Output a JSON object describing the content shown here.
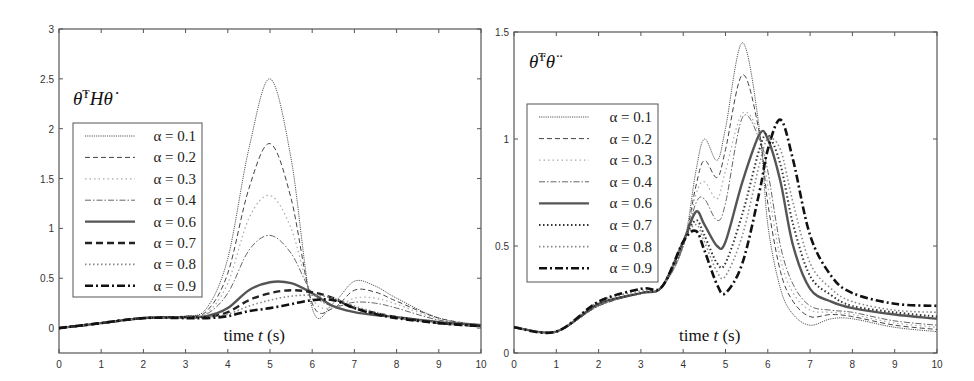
{
  "chart_data": [
    {
      "type": "line",
      "title": "θ̇ᵀHθ̇",
      "annotation": "time t (s)",
      "xlabel": "time t (s)",
      "ylabel": "",
      "xlim": [
        0,
        10
      ],
      "ylim": [
        -0.25,
        3
      ],
      "xticks": [
        "0",
        "1",
        "2",
        "3",
        "4",
        "5",
        "6",
        "7",
        "8",
        "9",
        "10"
      ],
      "yticks": [
        "0",
        "0.5",
        "1",
        "1.5",
        "2",
        "2.5",
        "3"
      ],
      "legend_position": "upper left (inside)",
      "x": [
        0,
        1,
        2,
        3,
        3.5,
        4,
        4.5,
        5,
        5.5,
        6,
        6.5,
        7,
        7.5,
        8,
        9,
        10
      ],
      "series": [
        {
          "name": "α = 0.1",
          "values": [
            0,
            0.05,
            0.1,
            0.12,
            0.2,
            0.7,
            1.8,
            2.5,
            1.7,
            0.2,
            0.25,
            0.47,
            0.42,
            0.3,
            0.1,
            0.03
          ]
        },
        {
          "name": "α = 0.2",
          "values": [
            0,
            0.05,
            0.1,
            0.12,
            0.17,
            0.55,
            1.4,
            1.85,
            1.3,
            0.25,
            0.2,
            0.38,
            0.36,
            0.27,
            0.1,
            0.03
          ]
        },
        {
          "name": "α = 0.3",
          "values": [
            0,
            0.05,
            0.1,
            0.12,
            0.15,
            0.45,
            1.1,
            1.33,
            1.0,
            0.3,
            0.2,
            0.3,
            0.3,
            0.24,
            0.09,
            0.03
          ]
        },
        {
          "name": "α = 0.4",
          "values": [
            0,
            0.05,
            0.1,
            0.11,
            0.14,
            0.35,
            0.78,
            0.93,
            0.75,
            0.35,
            0.22,
            0.26,
            0.25,
            0.2,
            0.08,
            0.03
          ]
        },
        {
          "name": "α = 0.6",
          "values": [
            0,
            0.05,
            0.1,
            0.11,
            0.12,
            0.2,
            0.38,
            0.46,
            0.45,
            0.35,
            0.22,
            0.16,
            0.13,
            0.11,
            0.06,
            0.03
          ]
        },
        {
          "name": "α = 0.7",
          "values": [
            0,
            0.05,
            0.1,
            0.11,
            0.11,
            0.16,
            0.28,
            0.35,
            0.38,
            0.36,
            0.3,
            0.2,
            0.15,
            0.11,
            0.05,
            0.02
          ]
        },
        {
          "name": "α = 0.8",
          "values": [
            0,
            0.05,
            0.1,
            0.11,
            0.11,
            0.14,
            0.22,
            0.28,
            0.32,
            0.33,
            0.3,
            0.22,
            0.16,
            0.11,
            0.05,
            0.02
          ]
        },
        {
          "name": "α = 0.9",
          "values": [
            0,
            0.05,
            0.1,
            0.1,
            0.1,
            0.12,
            0.17,
            0.2,
            0.24,
            0.28,
            0.28,
            0.2,
            0.14,
            0.1,
            0.05,
            0.02
          ]
        }
      ]
    },
    {
      "type": "line",
      "title": "θ̈ᵀθ̈",
      "annotation": "time t (s)",
      "xlabel": "time t (s)",
      "ylabel": "",
      "xlim": [
        0,
        10
      ],
      "ylim": [
        0,
        1.5
      ],
      "xticks": [
        "0",
        "1",
        "2",
        "3",
        "4",
        "5",
        "6",
        "7",
        "8",
        "9",
        "10"
      ],
      "yticks": [
        "0",
        "0.5",
        "1",
        "1.5"
      ],
      "legend_position": "upper left (inside)",
      "x": [
        0,
        1,
        2,
        3,
        3.5,
        4,
        4.3,
        4.5,
        4.8,
        5,
        5.4,
        5.8,
        6,
        6.3,
        6.6,
        7,
        7.5,
        8,
        9,
        10
      ],
      "series": [
        {
          "name": "α = 0.1",
          "values": [
            0.12,
            0.1,
            0.22,
            0.28,
            0.31,
            0.5,
            0.85,
            1.0,
            0.9,
            1.05,
            1.45,
            1.05,
            0.6,
            0.3,
            0.18,
            0.13,
            0.16,
            0.16,
            0.12,
            0.1
          ]
        },
        {
          "name": "α = 0.2",
          "values": [
            0.12,
            0.1,
            0.22,
            0.28,
            0.31,
            0.5,
            0.78,
            0.9,
            0.82,
            0.95,
            1.3,
            1.03,
            0.7,
            0.38,
            0.24,
            0.17,
            0.18,
            0.17,
            0.13,
            0.11
          ]
        },
        {
          "name": "α = 0.3",
          "values": [
            0.12,
            0.1,
            0.22,
            0.28,
            0.31,
            0.5,
            0.74,
            0.8,
            0.72,
            0.85,
            1.12,
            1.02,
            0.78,
            0.44,
            0.28,
            0.2,
            0.19,
            0.18,
            0.14,
            0.12
          ]
        },
        {
          "name": "α = 0.4",
          "values": [
            0.12,
            0.1,
            0.22,
            0.28,
            0.31,
            0.5,
            0.7,
            0.72,
            0.62,
            0.7,
            1.1,
            1.0,
            0.85,
            0.5,
            0.32,
            0.22,
            0.2,
            0.19,
            0.15,
            0.13
          ]
        },
        {
          "name": "α = 0.6",
          "values": [
            0.12,
            0.1,
            0.23,
            0.28,
            0.31,
            0.52,
            0.66,
            0.6,
            0.5,
            0.52,
            0.8,
            1.02,
            1.0,
            0.8,
            0.5,
            0.3,
            0.24,
            0.21,
            0.18,
            0.16
          ]
        },
        {
          "name": "α = 0.7",
          "values": [
            0.12,
            0.1,
            0.23,
            0.28,
            0.31,
            0.52,
            0.62,
            0.55,
            0.42,
            0.42,
            0.65,
            0.95,
            1.02,
            0.88,
            0.6,
            0.36,
            0.27,
            0.22,
            0.19,
            0.17
          ]
        },
        {
          "name": "α = 0.8",
          "values": [
            0.12,
            0.1,
            0.24,
            0.29,
            0.31,
            0.52,
            0.6,
            0.52,
            0.38,
            0.36,
            0.55,
            0.88,
            1.0,
            0.95,
            0.7,
            0.42,
            0.3,
            0.24,
            0.2,
            0.19
          ]
        },
        {
          "name": "α = 0.9",
          "values": [
            0.12,
            0.1,
            0.24,
            0.3,
            0.31,
            0.52,
            0.57,
            0.48,
            0.32,
            0.28,
            0.42,
            0.75,
            0.95,
            1.09,
            0.9,
            0.55,
            0.36,
            0.28,
            0.23,
            0.22
          ]
        }
      ]
    }
  ],
  "charts": {
    "left": {
      "title_main": "θ̇",
      "title_sup": "T",
      "title_rest": "Hθ̇",
      "time_label": "time t (s)",
      "legend": [
        "α = 0.1",
        "α = 0.2",
        "α = 0.3",
        "α = 0.4",
        "α = 0.6",
        "α = 0.7",
        "α = 0.8",
        "α = 0.9"
      ]
    },
    "right": {
      "title_main": "θ̈",
      "title_sup": "T",
      "title_rest": "θ̈",
      "time_label": "time t (s)",
      "legend": [
        "α = 0.1",
        "α = 0.2",
        "α = 0.3",
        "α = 0.4",
        "α = 0.6",
        "α = 0.7",
        "α = 0.8",
        "α = 0.9"
      ]
    }
  }
}
